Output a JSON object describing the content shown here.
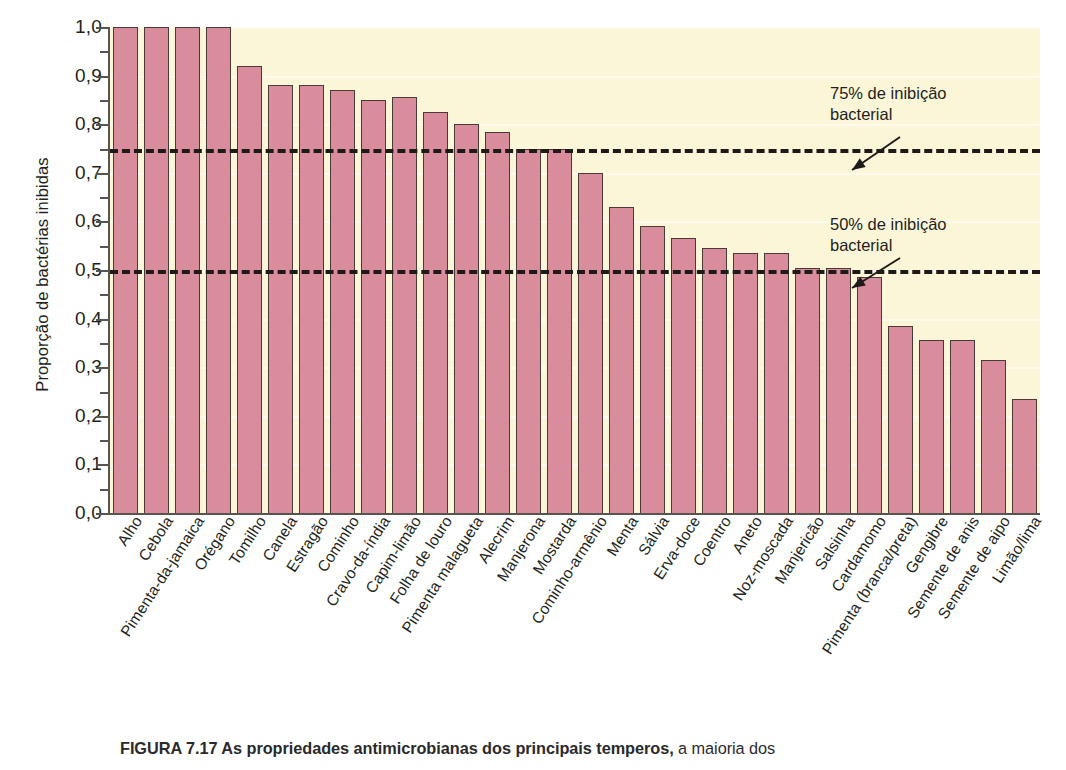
{
  "figure": {
    "caption_bold": "FIGURA 7.17   As propriedades antimicrobianas dos principais temperos,",
    "caption_rest": " a maioria dos"
  },
  "chart_data": {
    "type": "bar",
    "title": "",
    "xlabel": "",
    "ylabel": "Proporção de bactérias inibidas",
    "ylim": [
      0.0,
      1.0
    ],
    "grid": true,
    "legend_position": "none",
    "bar_color": "#d98d9c",
    "plot_background": "#fbf6d8",
    "y_ticks": [
      "0,0",
      "0,1",
      "0,2",
      "0,3",
      "0,4",
      "0,5",
      "0,6",
      "0,7",
      "0,8",
      "0,9",
      "1,0"
    ],
    "y_tick_values": [
      0.0,
      0.1,
      0.2,
      0.3,
      0.4,
      0.5,
      0.6,
      0.7,
      0.8,
      0.9,
      1.0
    ],
    "categories": [
      "Alho",
      "Cebola",
      "Pimenta-da-jamaica",
      "Orégano",
      "Tomilho",
      "Canela",
      "Estragão",
      "Cominho",
      "Cravo-da-índia",
      "Capim-limão",
      "Folha de louro",
      "Pimenta malagueta",
      "Alecrim",
      "Manjerona",
      "Mostarda",
      "Cominho-armênio",
      "Menta",
      "Sálvia",
      "Erva-doce",
      "Coentro",
      "Aneto",
      "Noz-moscada",
      "Manjericão",
      "Salsinha",
      "Cardamomo",
      "Pimenta (branca/preta)",
      "Gengibre",
      "Semente de anis",
      "Semente de aipo",
      "Limão/lima"
    ],
    "values": [
      1.0,
      1.0,
      1.0,
      1.0,
      0.92,
      0.88,
      0.88,
      0.87,
      0.85,
      0.855,
      0.825,
      0.8,
      0.785,
      0.75,
      0.75,
      0.7,
      0.63,
      0.59,
      0.565,
      0.545,
      0.535,
      0.535,
      0.505,
      0.505,
      0.485,
      0.385,
      0.355,
      0.355,
      0.315,
      0.235
    ],
    "reference_lines": [
      {
        "value": 0.75,
        "label": "75% de inibição\nbacterial",
        "style": "dashed"
      },
      {
        "value": 0.5,
        "label": "50% de inibição\nbacterial",
        "style": "dashed"
      }
    ]
  }
}
